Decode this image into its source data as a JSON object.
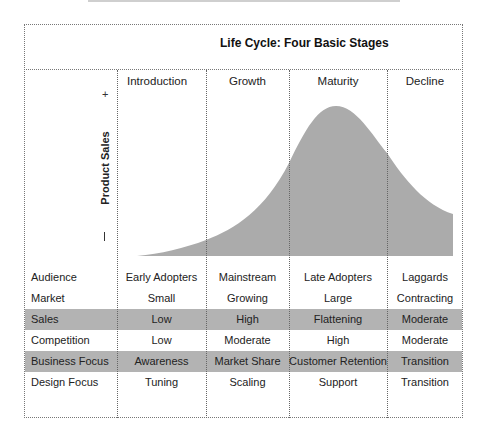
{
  "title": "Life Cycle: Four Basic Stages",
  "colors": {
    "curve_fill": "#ababab",
    "band_fill": "#b3b3b3",
    "border": "#777777"
  },
  "chart": {
    "y_axis_label": "Product Sales",
    "y_high_marker": "+",
    "y_low_marker": "−"
  },
  "stages": [
    {
      "label": "Introduction"
    },
    {
      "label": "Growth"
    },
    {
      "label": "Maturity"
    },
    {
      "label": "Decline"
    }
  ],
  "rows": [
    {
      "label": "Audience",
      "values": [
        "Early Adopters",
        "Mainstream",
        "Late Adopters",
        "Laggards"
      ],
      "highlighted": false
    },
    {
      "label": "Market",
      "values": [
        "Small",
        "Growing",
        "Large",
        "Contracting"
      ],
      "highlighted": false
    },
    {
      "label": "Sales",
      "values": [
        "Low",
        "High",
        "Flattening",
        "Moderate"
      ],
      "highlighted": true
    },
    {
      "label": "Competition",
      "values": [
        "Low",
        "Moderate",
        "High",
        "Moderate"
      ],
      "highlighted": false
    },
    {
      "label": "Business Focus",
      "values": [
        "Awareness",
        "Market Share",
        "Customer Retention",
        "Transition"
      ],
      "highlighted": true
    },
    {
      "label": "Design Focus",
      "values": [
        "Tuning",
        "Scaling",
        "Support",
        "Transition"
      ],
      "highlighted": false
    }
  ]
}
